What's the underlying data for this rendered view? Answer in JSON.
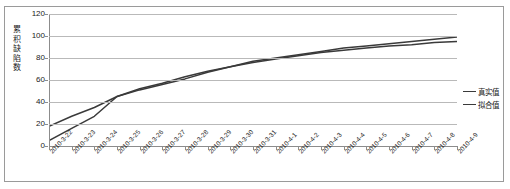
{
  "chart_data": {
    "type": "line",
    "title": "",
    "xlabel": "",
    "ylabel": "累积缺陷数",
    "ylim": [
      0,
      120
    ],
    "yticks": [
      0,
      20,
      40,
      60,
      80,
      100,
      120
    ],
    "grid": true,
    "legend_position": "right",
    "categories": [
      "2010-3-22",
      "2010-3-23",
      "2010-3-24",
      "2010-3-25",
      "2010-3-26",
      "2010-3-27",
      "2010-3-28",
      "2010-3-29",
      "2010-3-30",
      "2010-3-31",
      "2010-4-1",
      "2010-4-2",
      "2010-4-3",
      "2010-4-4",
      "2010-4-5",
      "2010-4-6",
      "2010-4-7",
      "2010-4-8",
      "2010-4-9"
    ],
    "series": [
      {
        "name": "真实值",
        "color": "#3a3a3a",
        "values": [
          18,
          27,
          35,
          45,
          52,
          57,
          63,
          68,
          72,
          77,
          80,
          83,
          86,
          89,
          91,
          93,
          95,
          97,
          99
        ]
      },
      {
        "name": "拟合值",
        "color": "#3a3a3a",
        "values": [
          5,
          16,
          27,
          45,
          51,
          56,
          61,
          67,
          72,
          76,
          79,
          82,
          85,
          87,
          89,
          91,
          92,
          94,
          95
        ]
      }
    ]
  },
  "legend": {
    "items": [
      {
        "label": "真实值"
      },
      {
        "label": "拟合值"
      }
    ]
  },
  "axis": {
    "y_title_chars": [
      "累",
      "积",
      "缺",
      "陷",
      "数"
    ]
  }
}
